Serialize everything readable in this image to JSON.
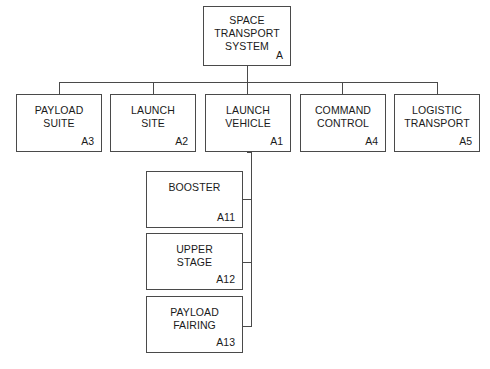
{
  "diagram": {
    "type": "work-breakdown-structure",
    "line_color": "#4a4a4a",
    "background_color": "#ffffff",
    "text_color": "#1a1a1a"
  },
  "nodes": {
    "root": {
      "title": "SPACE\nTRANSPORT\nSYSTEM",
      "code": "A"
    },
    "a3": {
      "title": "PAYLOAD\nSUITE",
      "code": "A3"
    },
    "a2": {
      "title": "LAUNCH\nSITE",
      "code": "A2"
    },
    "a1": {
      "title": "LAUNCH\nVEHICLE",
      "code": "A1"
    },
    "a4": {
      "title": "COMMAND\nCONTROL",
      "code": "A4"
    },
    "a5": {
      "title": "LOGISTIC\nTRANSPORT",
      "code": "A5"
    },
    "a11": {
      "title": "BOOSTER",
      "code": "A11"
    },
    "a12": {
      "title": "UPPER\nSTAGE",
      "code": "A12"
    },
    "a13": {
      "title": "PAYLOAD\nFAIRING",
      "code": "A13"
    }
  },
  "hierarchy": {
    "A": [
      "A3",
      "A2",
      "A1",
      "A4",
      "A5"
    ],
    "A1": [
      "A11",
      "A12",
      "A13"
    ]
  }
}
